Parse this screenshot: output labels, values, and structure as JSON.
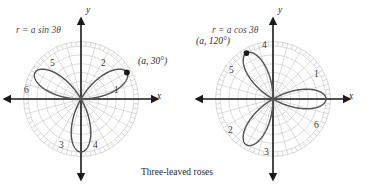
{
  "figure": {
    "caption": "Three-leaved roses",
    "background_color": "#ffffff",
    "curve_color": "#555555",
    "grid_color": "#bfbfbf",
    "axis_color": "#1a1a1a"
  },
  "plots": [
    {
      "id": "left",
      "equation": "r = a sin 3θ",
      "point_label": "(a, 30°)",
      "point_theta_deg": 30,
      "x_axis_label": "x",
      "y_axis_label": "y",
      "petal_numbers": [
        "1",
        "2",
        "3",
        "4",
        "5",
        "6"
      ],
      "center": {
        "x": 81,
        "y": 99
      },
      "radius": 53
    },
    {
      "id": "right",
      "equation": "r = a cos 3θ",
      "point_label": "(a, 120°)",
      "point_theta_deg": 120,
      "x_axis_label": "x",
      "y_axis_label": "y",
      "petal_numbers": [
        "1",
        "2",
        "3",
        "4",
        "5",
        "6"
      ],
      "center": {
        "x": 273,
        "y": 99
      },
      "radius": 53
    }
  ],
  "chart_data": {
    "type": "line",
    "title": "Three-leaved roses",
    "coordinate_system": "polar",
    "xlabel": "x",
    "ylabel": "y",
    "grid": true,
    "legend": "none",
    "series": [
      {
        "name": "r = a sin 3θ",
        "plot": "left",
        "equation": "r = a*sin(3*theta)",
        "amplitude_a": 1,
        "petal_count": 3,
        "petal_axis_angles_deg": [
          30,
          150,
          270
        ],
        "annotation": {
          "label": "(a, 30°)",
          "r": 1,
          "theta_deg": 30
        },
        "sector_numbers": {
          "1": "0° to 60° lower-right region label",
          "2": "petal near 30°",
          "3": "sector near 240°",
          "4": "sector near 300°",
          "5": "petal near 150°",
          "6": "sector near 180°"
        }
      },
      {
        "name": "r = a cos 3θ",
        "plot": "right",
        "equation": "r = a*cos(3*theta)",
        "amplitude_a": 1,
        "petal_count": 3,
        "petal_axis_angles_deg": [
          0,
          120,
          240
        ],
        "annotation": {
          "label": "(a, 120°)",
          "r": 1,
          "theta_deg": 120
        },
        "sector_numbers": {
          "1": "upper-right near 30°",
          "2": "lower-left near 210°",
          "3": "lower near 280°",
          "4": "upper near 80°",
          "5": "upper-left near 150°",
          "6": "lower-right near 330°"
        }
      }
    ],
    "axis_ranges": {
      "r_min": 0,
      "r_max": 1
    }
  }
}
